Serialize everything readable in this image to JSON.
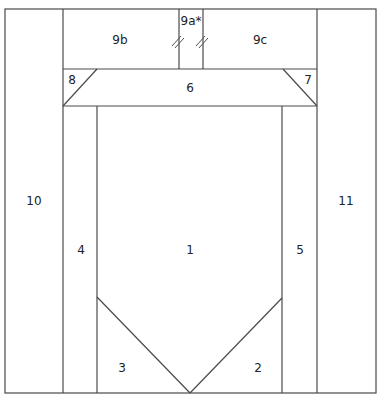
{
  "diagram": {
    "type": "quilt-block-piecing-diagram",
    "pieces": [
      {
        "id": "1",
        "label": "1",
        "x": 190,
        "y": 250
      },
      {
        "id": "2",
        "label": "2",
        "x": 258,
        "y": 368
      },
      {
        "id": "3",
        "label": "3",
        "x": 122,
        "y": 368
      },
      {
        "id": "4",
        "label": "4",
        "x": 81,
        "y": 250
      },
      {
        "id": "5",
        "label": "5",
        "x": 300,
        "y": 250
      },
      {
        "id": "6",
        "label": "6",
        "x": 190,
        "y": 88
      },
      {
        "id": "7",
        "label": "7",
        "x": 307,
        "y": 80
      },
      {
        "id": "8",
        "label": "8",
        "x": 72,
        "y": 80
      },
      {
        "id": "9a",
        "label": "9a*",
        "x": 191,
        "y": 22
      },
      {
        "id": "9b",
        "label": "9b",
        "x": 120,
        "y": 40
      },
      {
        "id": "9c",
        "label": "9c",
        "x": 260,
        "y": 40
      },
      {
        "id": "10",
        "label": "10",
        "x": 33,
        "y": 201
      },
      {
        "id": "11",
        "label": "11",
        "x": 346,
        "y": 201
      }
    ],
    "line_color": "#4a4a4a",
    "background": "#ffffff"
  }
}
